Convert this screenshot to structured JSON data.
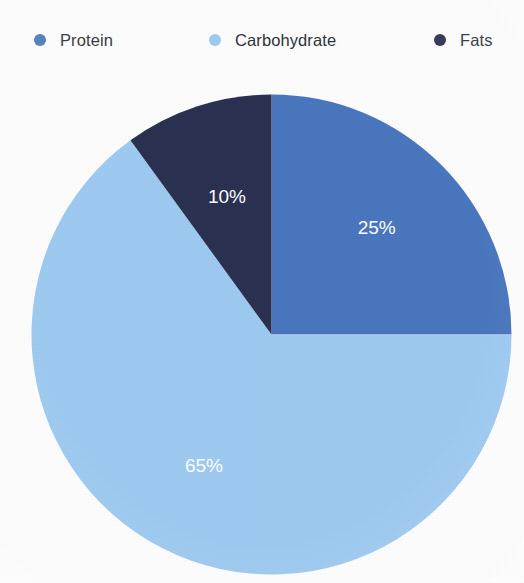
{
  "chart_data": {
    "type": "pie",
    "title": "",
    "categories": [
      "Protein",
      "Carbohydrate",
      "Fats"
    ],
    "values": [
      25,
      65,
      10
    ],
    "value_labels": [
      "25%",
      "65%",
      "10%"
    ],
    "colors": [
      "#4a77c0",
      "#9fcbf2",
      "#2b3251"
    ],
    "legend_position": "top",
    "label_color": "#ffffff",
    "start_angle_deg": 0,
    "direction": "clockwise",
    "units": "percent"
  },
  "legend": {
    "items": [
      {
        "label": "Protein",
        "color": "#4a77c0",
        "swatch": "legend-dot"
      },
      {
        "label": "Carbohydrate",
        "color": "#9fcbf2",
        "swatch": "legend-dot"
      },
      {
        "label": "Fats",
        "color": "#2b3251",
        "swatch": "legend-dot"
      }
    ]
  },
  "slices": [
    {
      "name": "Protein",
      "label": "25%",
      "color": "#4a77c0"
    },
    {
      "name": "Carbohydrate",
      "label": "65%",
      "color": "#9fcbf2"
    },
    {
      "name": "Fats",
      "label": "10%",
      "color": "#2b3251"
    }
  ]
}
